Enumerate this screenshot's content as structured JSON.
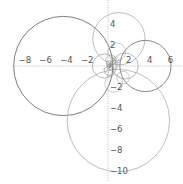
{
  "chart_data": {
    "type": "scatter",
    "title": "",
    "xlabel": "",
    "ylabel": "",
    "xlim": [
      -9.2,
      7.2
    ],
    "ylim": [
      -11,
      6.3
    ],
    "grid": false,
    "legend": null,
    "x_ticks": [
      {
        "value": -8,
        "label": "−8"
      },
      {
        "value": -6,
        "label": "−6"
      },
      {
        "value": -4,
        "label": "−4"
      },
      {
        "value": -2,
        "label": "−2"
      },
      {
        "value": 2,
        "label": "2"
      },
      {
        "value": 4,
        "label": "4"
      },
      {
        "value": 6,
        "label": "6"
      }
    ],
    "y_ticks": [
      {
        "value": 4,
        "label": "4"
      },
      {
        "value": 2,
        "label": "2"
      },
      {
        "value": -2,
        "label": "−2"
      },
      {
        "value": -4,
        "label": "−4"
      },
      {
        "value": -6,
        "label": "−6"
      },
      {
        "value": -8,
        "label": "−8"
      },
      {
        "value": -10,
        "label": "−10"
      }
    ],
    "circles": [
      {
        "cx": -4.3,
        "cy": 0.0,
        "r": 4.75,
        "color": "#6e6e6e"
      },
      {
        "cx": 1.0,
        "cy": -5.2,
        "r": 4.9,
        "color": "#b5b5b5"
      },
      {
        "cx": 1.05,
        "cy": 2.6,
        "r": 2.5,
        "color": "#b5b5b5"
      },
      {
        "cx": 3.6,
        "cy": 0.0,
        "r": 2.45,
        "color": "#7a7a7a"
      },
      {
        "cx": -0.35,
        "cy": 0.0,
        "r": 1.15,
        "color": "#8a8a8a"
      },
      {
        "cx": 1.65,
        "cy": 0.0,
        "r": 1.25,
        "color": "#8a8a8a"
      },
      {
        "cx": 0.85,
        "cy": 1.35,
        "r": 0.85,
        "color": "#a8a8a8"
      },
      {
        "cx": 0.55,
        "cy": -1.65,
        "r": 0.85,
        "color": "#a8a8a8"
      },
      {
        "cx": 1.45,
        "cy": -1.1,
        "r": 0.6,
        "color": "#a8a8a8"
      },
      {
        "cx": 0.3,
        "cy": 0.55,
        "r": 0.5,
        "color": "#999999"
      },
      {
        "cx": 0.1,
        "cy": -0.45,
        "r": 0.45,
        "color": "#999999"
      },
      {
        "cx": 0.55,
        "cy": 0.1,
        "r": 0.4,
        "color": "#999999"
      },
      {
        "cx": 0.15,
        "cy": 0.2,
        "r": 0.3,
        "color": "#888888"
      },
      {
        "cx": 0.3,
        "cy": -0.15,
        "r": 0.25,
        "color": "#888888"
      },
      {
        "cx": 0.1,
        "cy": 0.0,
        "r": 0.18,
        "color": "#777777"
      },
      {
        "cx": 0.22,
        "cy": 0.1,
        "r": 0.12,
        "color": "#777777"
      }
    ],
    "rays": [
      {
        "angle_deg": 30,
        "length": 1.3
      },
      {
        "angle_deg": 45,
        "length": 1.2
      },
      {
        "angle_deg": 60,
        "length": 1.0
      },
      {
        "angle_deg": 20,
        "length": 1.1
      },
      {
        "angle_deg": 75,
        "length": 0.9
      },
      {
        "angle_deg": 210,
        "length": 0.8
      },
      {
        "angle_deg": 240,
        "length": 0.9
      },
      {
        "angle_deg": 260,
        "length": 1.1
      }
    ],
    "pixel_mapping": {
      "origin_x": 108,
      "origin_y": 66,
      "px_per_unit_x": 10.4,
      "px_per_unit_y": 10.5
    }
  }
}
